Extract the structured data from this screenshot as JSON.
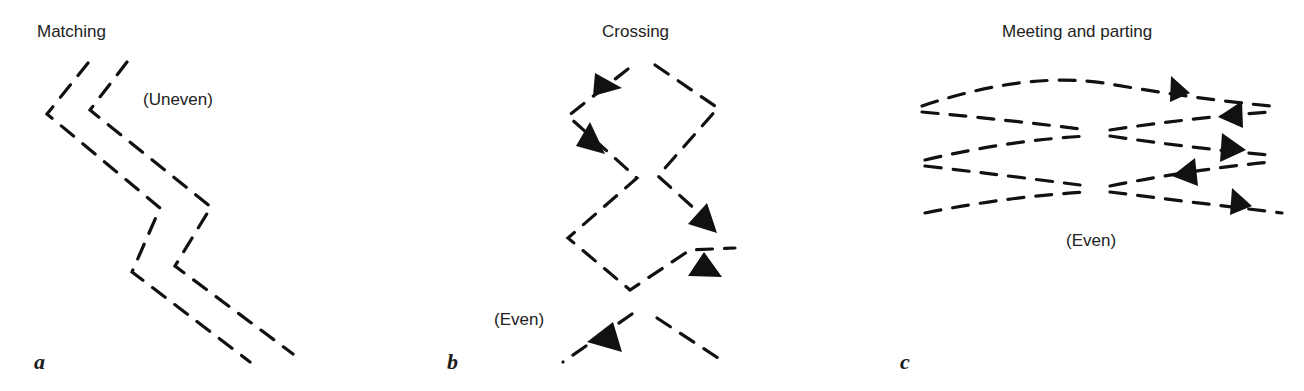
{
  "figure": {
    "panels": [
      {
        "letter": "a",
        "title": "Matching",
        "annotation": "(Uneven)",
        "description": "Two parallel dashed zig-zag paths that match each other"
      },
      {
        "letter": "b",
        "title": "Crossing",
        "annotation": "(Even)",
        "description": "Two dashed zig-zag paths that cross each other, with arrowheads indicating direction"
      },
      {
        "letter": "c",
        "title": "Meeting and parting",
        "annotation": "(Even)",
        "description": "Rows of dashed curves that meet and part, with arrowheads indicating direction"
      }
    ],
    "colors": {
      "stroke": "#111111",
      "text": "#222222",
      "background": "#ffffff"
    }
  }
}
